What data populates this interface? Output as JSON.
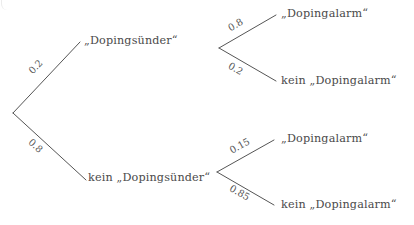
{
  "diagram": {
    "type": "probability-tree",
    "background_color": "#ffffff",
    "line_color": "#555555",
    "text_color": "#4a4a4a",
    "root": {
      "label": ""
    },
    "level1": [
      {
        "id": "dopingsuender",
        "label": "„Dopingsünder“",
        "probability": "0.2",
        "probability_value": 0.2
      },
      {
        "id": "kein-dopingsuender",
        "label": "kein „Dopingsünder“",
        "probability": "0.8",
        "probability_value": 0.8
      }
    ],
    "level2": [
      {
        "parent": "dopingsuender",
        "id": "alarm-1",
        "label": "„Dopingalarm“",
        "probability": "0.8",
        "probability_value": 0.8
      },
      {
        "parent": "dopingsuender",
        "id": "kein-alarm-1",
        "label": "kein „Dopingalarm“",
        "probability": "0.2",
        "probability_value": 0.2
      },
      {
        "parent": "kein-dopingsuender",
        "id": "alarm-2",
        "label": "„Dopingalarm“",
        "probability": "0.15",
        "probability_value": 0.15
      },
      {
        "parent": "kein-dopingsuender",
        "id": "kein-alarm-2",
        "label": "kein „Dopingalarm“",
        "probability": "0.85",
        "probability_value": 0.85
      }
    ]
  }
}
